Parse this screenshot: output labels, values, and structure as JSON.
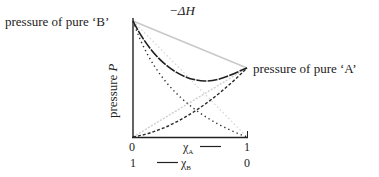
{
  "diagram": {
    "title_annotation": "−ΔH",
    "label_pure_b": "pressure of pure ‘B’",
    "label_pure_a": "pressure of pure ‘A’",
    "y_axis_label_text": "pressure ",
    "y_axis_label_symbol": "P",
    "x_axis_top": {
      "left_tick": "0",
      "right_tick": "1",
      "symbol": "χ",
      "subscript": "A"
    },
    "x_axis_bottom": {
      "left_tick": "1",
      "right_tick": "0",
      "symbol": "χ",
      "subscript": "B"
    },
    "curves": [
      {
        "name": "ideal total pressure",
        "style": "light solid",
        "color": "#c8c8c8"
      },
      {
        "name": "actual total pressure (negative deviation)",
        "style": "dash",
        "color": "#222222"
      },
      {
        "name": "partial pressure B (ideal)",
        "style": "light dotted",
        "color": "#cfcfcf"
      },
      {
        "name": "partial pressure B (actual)",
        "style": "dotted",
        "color": "#333333"
      },
      {
        "name": "partial pressure A (ideal)",
        "style": "light dotted",
        "color": "#cfcfcf"
      },
      {
        "name": "partial pressure A (actual)",
        "style": "dashed",
        "color": "#333333"
      }
    ]
  }
}
